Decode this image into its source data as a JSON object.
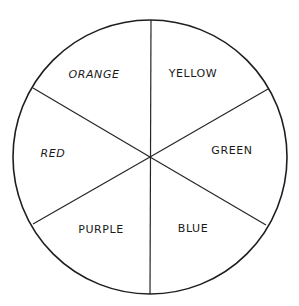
{
  "diagram": {
    "type": "color-wheel",
    "center": [
      150,
      157
    ],
    "radius": 137,
    "outline_color": "#1e1e1e",
    "background_color": "#ffffff",
    "segments": [
      {
        "label": "YELLOW",
        "position": "top-right",
        "label_x": 193,
        "label_y": 77
      },
      {
        "label": "GREEN",
        "position": "right",
        "label_x": 232,
        "label_y": 154
      },
      {
        "label": "BLUE",
        "position": "bottom-right",
        "label_x": 193,
        "label_y": 232
      },
      {
        "label": "PURPLE",
        "position": "bottom-left",
        "label_x": 101,
        "label_y": 233
      },
      {
        "label": "RED",
        "position": "left",
        "label_x": 53,
        "label_y": 157
      },
      {
        "label": "ORANGE",
        "position": "top-left",
        "label_x": 94,
        "label_y": 78
      }
    ],
    "dividers": [
      {
        "name": "vertical-divider",
        "x1": 151,
        "y1": 20,
        "x2": 150,
        "y2": 294
      },
      {
        "name": "upper-left-divider",
        "x1": 33,
        "y1": 88,
        "x2": 150,
        "y2": 157
      },
      {
        "name": "upper-right-divider",
        "x1": 268,
        "y1": 89,
        "x2": 150,
        "y2": 157
      },
      {
        "name": "lower-left-divider",
        "x1": 33,
        "y1": 224,
        "x2": 150,
        "y2": 157
      },
      {
        "name": "lower-right-divider",
        "x1": 266,
        "y1": 225,
        "x2": 150,
        "y2": 157
      }
    ]
  }
}
